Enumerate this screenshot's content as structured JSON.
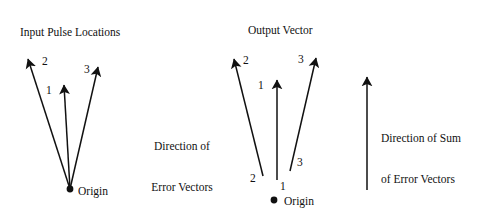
{
  "figure": {
    "background_color": "#ffffff",
    "ink_color": "#111111",
    "width": 481,
    "height": 215
  },
  "panels": {
    "input": {
      "title": "Input Pulse Locations",
      "origin_label": "Origin",
      "vectors": [
        {
          "label": "1",
          "label_x": 46,
          "label_y": 84,
          "x1": 70,
          "y1": 189,
          "x2": 64,
          "y2": 85
        },
        {
          "label": "2",
          "label_x": 42,
          "label_y": 55,
          "x1": 70,
          "y1": 189,
          "x2": 28,
          "y2": 59
        },
        {
          "label": "3",
          "label_x": 84,
          "label_y": 63,
          "x1": 70,
          "y1": 189,
          "x2": 98,
          "y2": 67
        }
      ],
      "origin_dot": {
        "x": 70,
        "y": 189,
        "r": 3.4
      },
      "origin_label_x": 78,
      "origin_label_y": 185
    },
    "output": {
      "title": "Output Vector",
      "origin_label": "Origin",
      "vectors": [
        {
          "label_base": "1",
          "label_tip": "1",
          "base_label_x": 280,
          "base_label_y": 180,
          "tip_label_x": 258,
          "tip_label_y": 79,
          "x1": 277,
          "y1": 180,
          "x2": 277,
          "y2": 80
        },
        {
          "label_base": "2",
          "label_tip": "2",
          "base_label_x": 250,
          "base_label_y": 172,
          "tip_label_x": 243,
          "tip_label_y": 54,
          "x1": 263,
          "y1": 176,
          "x2": 234,
          "y2": 59
        },
        {
          "label_base": "3",
          "label_tip": "3",
          "base_label_x": 297,
          "base_label_y": 156,
          "tip_label_x": 298,
          "tip_label_y": 53,
          "x1": 290,
          "y1": 171,
          "x2": 316,
          "y2": 58
        }
      ],
      "origin_dot": {
        "x": 274,
        "y": 200,
        "r": 3.4
      },
      "origin_label_x": 284,
      "origin_label_y": 195
    },
    "sum": {
      "arrow": {
        "x1": 367,
        "y1": 190,
        "x2": 367,
        "y2": 77
      }
    }
  },
  "annotations": {
    "error_vectors_note": {
      "line1": "Direction of",
      "line2": "Error Vectors",
      "x": 140,
      "y": 113,
      "width": 84
    },
    "sum_error_vectors_note": {
      "line1": "Direction of Sum",
      "line2": "of Error Vectors",
      "x": 381,
      "y": 105,
      "width": 100
    }
  }
}
